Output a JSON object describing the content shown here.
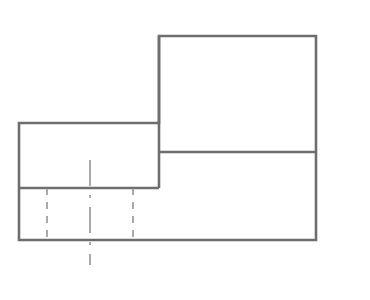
{
  "page": {
    "width": 370,
    "height": 300,
    "background_color": "#ffffff"
  },
  "drawing": {
    "type": "technical-line-drawing",
    "description": "Two-view style orthographic outline of a stepped block with hidden detail lines and a vertical centerline",
    "style": {
      "visible_line_color": "#6e6e6e",
      "visible_line_width": 2.6,
      "hidden_line_color": "#8d8d8d",
      "hidden_line_width": 1.5,
      "hidden_dash_pattern": "7 7",
      "center_line_color": "#8d8d8d",
      "center_line_width": 1.5,
      "center_dash_pattern": "26 9 3 9",
      "line_cap": "butt",
      "line_join": "miter"
    },
    "bounds": {
      "left": 19,
      "right": 316,
      "top": 36,
      "bottom": 240
    },
    "key_points": {
      "outer_top_left_x": 159,
      "outer_top_y": 36,
      "outer_right_x": 316,
      "upper_step_bottom_y": 152,
      "left_block_top_y": 123,
      "left_block_left_x": 19,
      "left_block_bottom_y": 188,
      "outer_bottom_y": 240
    },
    "visible_outline": {
      "name": "outer-profile",
      "closed": true,
      "points": [
        [
          159,
          36
        ],
        [
          316,
          36
        ],
        [
          316,
          240
        ],
        [
          19,
          240
        ],
        [
          19,
          123
        ],
        [
          159,
          123
        ]
      ]
    },
    "visible_internal_lines": [
      {
        "name": "step-horizontal-right",
        "x1": 159,
        "y1": 152,
        "x2": 316,
        "y2": 152
      },
      {
        "name": "step-vertical-left",
        "x1": 159,
        "y1": 36,
        "x2": 159,
        "y2": 188
      },
      {
        "name": "step-horizontal-left",
        "x1": 19,
        "y1": 188,
        "x2": 159,
        "y2": 188
      }
    ],
    "hidden_lines": [
      {
        "name": "hidden-line-1",
        "x1": 47,
        "y1": 188,
        "x2": 47,
        "y2": 240
      },
      {
        "name": "hidden-line-2",
        "x1": 133,
        "y1": 188,
        "x2": 133,
        "y2": 240
      }
    ],
    "center_lines": [
      {
        "name": "vertical-centerline",
        "x1": 90,
        "y1": 160,
        "x2": 90,
        "y2": 265
      }
    ]
  }
}
